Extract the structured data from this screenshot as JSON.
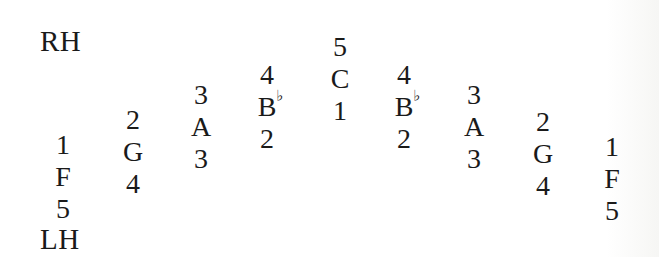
{
  "figure": {
    "rh_label": "RH",
    "lh_label": "LH",
    "columns": [
      {
        "rh_finger": "1",
        "note": "F",
        "accidental": "",
        "lh_finger": "5",
        "x": 63,
        "top": 129
      },
      {
        "rh_finger": "2",
        "note": "G",
        "accidental": "",
        "lh_finger": "4",
        "x": 133,
        "top": 104
      },
      {
        "rh_finger": "3",
        "note": "A",
        "accidental": "",
        "lh_finger": "3",
        "x": 201,
        "top": 79
      },
      {
        "rh_finger": "4",
        "note": "B",
        "accidental": "♭",
        "lh_finger": "2",
        "x": 267,
        "top": 59
      },
      {
        "rh_finger": "5",
        "note": "C",
        "accidental": "",
        "lh_finger": "1",
        "x": 340,
        "top": 31
      },
      {
        "rh_finger": "4",
        "note": "B",
        "accidental": "♭",
        "lh_finger": "2",
        "x": 404,
        "top": 59
      },
      {
        "rh_finger": "3",
        "note": "A",
        "accidental": "",
        "lh_finger": "3",
        "x": 474,
        "top": 79
      },
      {
        "rh_finger": "2",
        "note": "G",
        "accidental": "",
        "lh_finger": "4",
        "x": 543,
        "top": 106
      },
      {
        "rh_finger": "1",
        "note": "F",
        "accidental": "",
        "lh_finger": "5",
        "x": 612,
        "top": 131
      }
    ]
  }
}
